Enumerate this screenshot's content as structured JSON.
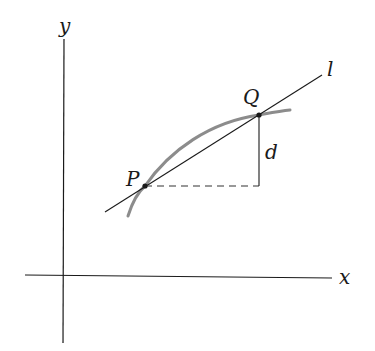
{
  "diagram": {
    "axes": {
      "x_label": "x",
      "y_label": "y"
    },
    "line": {
      "label": "l"
    },
    "points": {
      "P": "P",
      "Q": "Q"
    },
    "distance": {
      "label": "d"
    },
    "colors": {
      "axis": "#1a1a1a",
      "line": "#1a1a1a",
      "curve": "#8c8c8c",
      "dashed": "#333333"
    }
  }
}
